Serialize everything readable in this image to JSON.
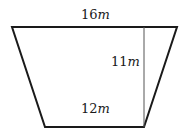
{
  "figure": {
    "type": "trapezoid",
    "stroke_color": "#1a1a1a",
    "height_line_color": "#555555",
    "vertices": {
      "top_left": [
        12,
        27
      ],
      "top_right": [
        177,
        27
      ],
      "bottom_right": [
        144,
        127
      ],
      "bottom_left": [
        45,
        127
      ]
    },
    "height_line": {
      "x": 144,
      "y1": 27,
      "y2": 127
    }
  },
  "labels": {
    "top_base": {
      "value": "16",
      "unit": "m"
    },
    "height": {
      "value": "11",
      "unit": "m"
    },
    "bottom_base": {
      "value": "12",
      "unit": "m"
    }
  }
}
